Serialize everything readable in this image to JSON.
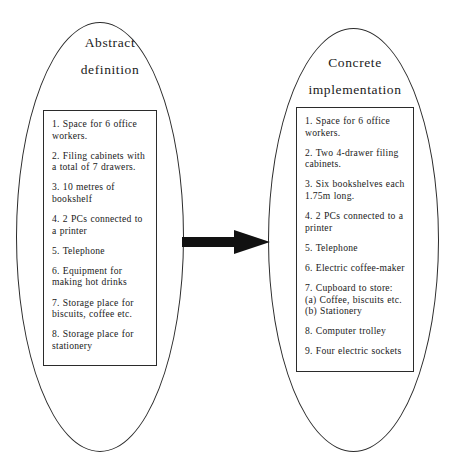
{
  "diagram": {
    "type": "two-ellipse-comparison",
    "background_color": "#ffffff",
    "ink_color": "#2b2b2b"
  },
  "left": {
    "heading_line1": "Abstract",
    "heading_line2": "definition",
    "items": [
      {
        "text": "1. Space for 6 office workers."
      },
      {
        "text": "2. Filing cabinets with a total of 7 drawers."
      },
      {
        "text": "3. 10 metres of bookshelf"
      },
      {
        "text": "4. 2 PCs connected to a printer"
      },
      {
        "text": "5. Telephone"
      },
      {
        "text": "6. Equipment for making hot drinks"
      },
      {
        "text": "7. Storage place for biscuits, coffee etc."
      },
      {
        "text": "8. Storage place for stationery"
      }
    ]
  },
  "right": {
    "heading_line1": "Concrete",
    "heading_line2": "implementation",
    "items": [
      {
        "text": "1. Space for 6 office workers."
      },
      {
        "text": "2. Two 4-drawer filing cabinets."
      },
      {
        "text": "3. Six bookshelves each 1.75m long."
      },
      {
        "text": "4. 2 PCs connected to a printer"
      },
      {
        "text": "5. Telephone"
      },
      {
        "text": "6. Electric coffee-maker"
      },
      {
        "text": "7. Cupboard to store:",
        "sub_a": "(a) Coffee, biscuits etc.",
        "sub_b": "(b) Stationery"
      },
      {
        "text": "8. Computer trolley"
      },
      {
        "text": "9. Four electric sockets"
      }
    ]
  },
  "arrow": {
    "name": "rightward-arrow",
    "direction": "right",
    "color": "#111111"
  }
}
